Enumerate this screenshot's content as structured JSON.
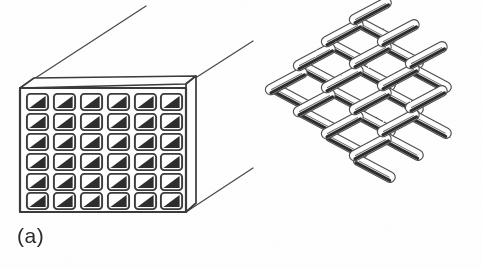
{
  "figure": {
    "kind": "two-panel line drawing",
    "background_color": "#ffffff",
    "ink_color": "#3a3a3a",
    "shade_color": "#2e2e2e",
    "panels": [
      {
        "id": "a",
        "caption": "(a)",
        "subject": "honeycomb-monolith-block",
        "description": "rectangular block in oblique projection with a square-channel front face",
        "grid": {
          "columns": 6,
          "rows": 6,
          "cell_count": 36
        },
        "cell": {
          "shape": "rounded-square",
          "shading": "dark triangle filling the lower-right half",
          "shading_corner": "lower-right"
        },
        "front_face": {
          "x": 20,
          "y": 88,
          "width": 166,
          "height": 124
        },
        "depth_direction": "up-and-to-the-right",
        "edges": [
          "top-face",
          "right-face",
          "receding-top-left",
          "receding-top-right",
          "receding-bottom-right"
        ]
      },
      {
        "id": "b",
        "caption": "(b)",
        "subject": "woven-wire-mesh",
        "description": "plain-weave screen of crossing cylindrical strands drawn in perspective",
        "weave": {
          "type": "plain",
          "warp_count": 5,
          "weft_count": 5,
          "warp_angle_deg": -28,
          "weft_angle_deg": 28,
          "strand_shape": "cylindrical"
        },
        "bounds": {
          "x": 268,
          "y": 118,
          "width": 200,
          "height": 92
        }
      }
    ]
  }
}
